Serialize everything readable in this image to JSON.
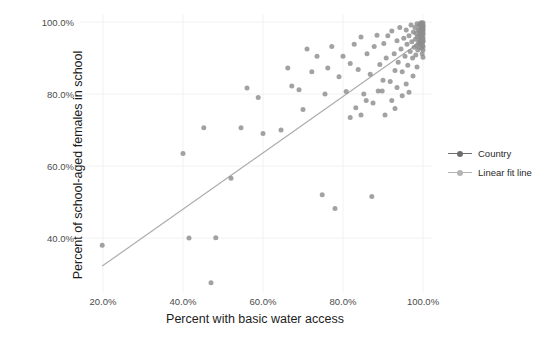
{
  "chart_data": {
    "type": "scatter",
    "title": "",
    "xlabel": "Percent with basic water access",
    "ylabel": "Percent of school-aged females in school",
    "xlim": [
      0.15,
      1.03
    ],
    "ylim": [
      0.24,
      1.03
    ],
    "xticks": [
      "20.0%",
      "40.0%",
      "60.0%",
      "80.0%",
      "100.0%"
    ],
    "xtick_values": [
      0.2,
      0.4,
      0.6,
      0.8,
      1.0
    ],
    "yticks": [
      "40.0%",
      "60.0%",
      "80.0%",
      "100.0%"
    ],
    "ytick_values": [
      0.4,
      0.6,
      0.8,
      1.0
    ],
    "grid": "faint",
    "legend_position": "right",
    "legend": [
      {
        "name": "Country",
        "marker": "line-with-dot",
        "color": "#6e6e6e"
      },
      {
        "name": "Linear fit line",
        "marker": "line-with-dot",
        "color": "#b4b4b4"
      }
    ],
    "series": [
      {
        "name": "Country",
        "type": "scatter",
        "color": "#8d8d8d",
        "marker_size": 5,
        "points": [
          [
            0.198,
            0.38
          ],
          [
            0.4,
            0.635
          ],
          [
            0.415,
            0.4
          ],
          [
            0.452,
            0.706
          ],
          [
            0.47,
            0.276
          ],
          [
            0.482,
            0.401
          ],
          [
            0.52,
            0.566
          ],
          [
            0.545,
            0.706
          ],
          [
            0.56,
            0.817
          ],
          [
            0.588,
            0.79
          ],
          [
            0.6,
            0.69
          ],
          [
            0.645,
            0.7
          ],
          [
            0.662,
            0.872
          ],
          [
            0.672,
            0.822
          ],
          [
            0.69,
            0.812
          ],
          [
            0.7,
            0.757
          ],
          [
            0.71,
            0.925
          ],
          [
            0.722,
            0.862
          ],
          [
            0.735,
            0.905
          ],
          [
            0.748,
            0.52
          ],
          [
            0.755,
            0.8
          ],
          [
            0.762,
            0.872
          ],
          [
            0.772,
            0.932
          ],
          [
            0.78,
            0.482
          ],
          [
            0.79,
            0.848
          ],
          [
            0.8,
            0.905
          ],
          [
            0.808,
            0.807
          ],
          [
            0.818,
            0.885
          ],
          [
            0.828,
            0.938
          ],
          [
            0.838,
            0.868
          ],
          [
            0.845,
            0.958
          ],
          [
            0.852,
            0.8
          ],
          [
            0.86,
            0.912
          ],
          [
            0.868,
            0.855
          ],
          [
            0.872,
            0.515
          ],
          [
            0.878,
            0.932
          ],
          [
            0.885,
            0.963
          ],
          [
            0.892,
            0.882
          ],
          [
            0.898,
            0.808
          ],
          [
            0.902,
            0.94
          ],
          [
            0.908,
            0.9
          ],
          [
            0.912,
            0.962
          ],
          [
            0.918,
            0.835
          ],
          [
            0.922,
            0.975
          ],
          [
            0.928,
            0.912
          ],
          [
            0.93,
            0.76
          ],
          [
            0.935,
            0.948
          ],
          [
            0.938,
            0.888
          ],
          [
            0.942,
            0.985
          ],
          [
            0.945,
            0.925
          ],
          [
            0.948,
            0.862
          ],
          [
            0.952,
            0.955
          ],
          [
            0.955,
            0.905
          ],
          [
            0.958,
            0.978
          ],
          [
            0.96,
            0.938
          ],
          [
            0.962,
            0.88
          ],
          [
            0.965,
            0.962
          ],
          [
            0.968,
            0.918
          ],
          [
            0.97,
            0.992
          ],
          [
            0.972,
            0.945
          ],
          [
            0.974,
            0.9
          ],
          [
            0.976,
            0.972
          ],
          [
            0.978,
            0.93
          ],
          [
            0.98,
            0.985
          ],
          [
            0.981,
            0.952
          ],
          [
            0.982,
            0.908
          ],
          [
            0.983,
            0.968
          ],
          [
            0.984,
            0.935
          ],
          [
            0.985,
            0.995
          ],
          [
            0.986,
            0.958
          ],
          [
            0.987,
            0.922
          ],
          [
            0.988,
            0.978
          ],
          [
            0.989,
            0.944
          ],
          [
            0.99,
            0.99
          ],
          [
            0.991,
            0.962
          ],
          [
            0.991,
            0.93
          ],
          [
            0.992,
            0.975
          ],
          [
            0.992,
            0.948
          ],
          [
            0.993,
            0.995
          ],
          [
            0.993,
            0.968
          ],
          [
            0.994,
            0.938
          ],
          [
            0.994,
            0.982
          ],
          [
            0.995,
            0.955
          ],
          [
            0.995,
            0.998
          ],
          [
            0.996,
            0.972
          ],
          [
            0.996,
            0.942
          ],
          [
            0.996,
            0.988
          ],
          [
            0.997,
            0.96
          ],
          [
            0.997,
            0.928
          ],
          [
            0.997,
            0.98
          ],
          [
            0.998,
            0.95
          ],
          [
            0.998,
            0.995
          ],
          [
            0.998,
            0.968
          ],
          [
            0.998,
            0.912
          ],
          [
            0.999,
            0.985
          ],
          [
            0.999,
            0.958
          ],
          [
            0.999,
            0.935
          ],
          [
            0.999,
            0.975
          ],
          [
            1.0,
            0.998
          ],
          [
            1.0,
            0.965
          ],
          [
            1.0,
            0.945
          ],
          [
            1.0,
            0.988
          ],
          [
            1.0,
            0.922
          ],
          [
            1.0,
            0.978
          ],
          [
            1.0,
            0.955
          ],
          [
            1.0,
            0.932
          ],
          [
            1.0,
            0.992
          ],
          [
            1.0,
            0.97
          ],
          [
            1.0,
            0.948
          ],
          [
            1.0,
            0.902
          ],
          [
            1.0,
            0.982
          ],
          [
            0.985,
            0.875
          ],
          [
            0.975,
            0.85
          ],
          [
            0.958,
            0.828
          ],
          [
            0.948,
            0.795
          ],
          [
            0.935,
            0.818
          ],
          [
            0.922,
            0.782
          ],
          [
            0.905,
            0.742
          ],
          [
            0.965,
            0.805
          ],
          [
            0.93,
            0.865
          ],
          [
            0.9,
            0.838
          ],
          [
            0.888,
            0.808
          ],
          [
            0.875,
            0.775
          ],
          [
            0.858,
            0.782
          ],
          [
            0.845,
            0.742
          ],
          [
            0.832,
            0.762
          ],
          [
            0.818,
            0.735
          ]
        ]
      },
      {
        "name": "Linear fit line",
        "type": "line",
        "color": "#adadad",
        "x_start": 0.198,
        "y_start": 0.322,
        "x_end": 1.003,
        "y_end": 0.952
      }
    ]
  },
  "axes": {
    "y_title": "Percent of school-aged females in school",
    "x_title": "Percent with basic water access",
    "y_tick_labels": [
      "100.0%",
      "80.0%",
      "60.0%",
      "40.0%"
    ],
    "x_tick_labels": [
      "20.0%",
      "40.0%",
      "60.0%",
      "80.0%",
      "100.0%"
    ]
  },
  "legend": {
    "items": [
      {
        "label": "Country",
        "color": "#6e6e6e"
      },
      {
        "label": "Linear fit line",
        "color": "#b4b4b4"
      }
    ]
  },
  "colors": {
    "point": "#8d8d8d",
    "fit_line": "#adadad",
    "grid": "#f2f2f2",
    "text": "#3a3a3a"
  }
}
